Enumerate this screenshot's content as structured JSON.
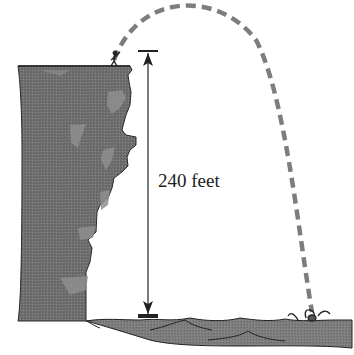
{
  "diagram": {
    "type": "projectile-from-cliff",
    "height_label": "240 feet",
    "elements": {
      "cliff": {
        "fill": "#6f6f6f",
        "highlight": "#8c8c8c"
      },
      "water": {
        "fill": "#7a7a7a"
      },
      "trajectory": {
        "stroke": "#7d7d7d",
        "style": "dashed"
      },
      "measure_line": {
        "stroke": "#222222"
      }
    }
  }
}
